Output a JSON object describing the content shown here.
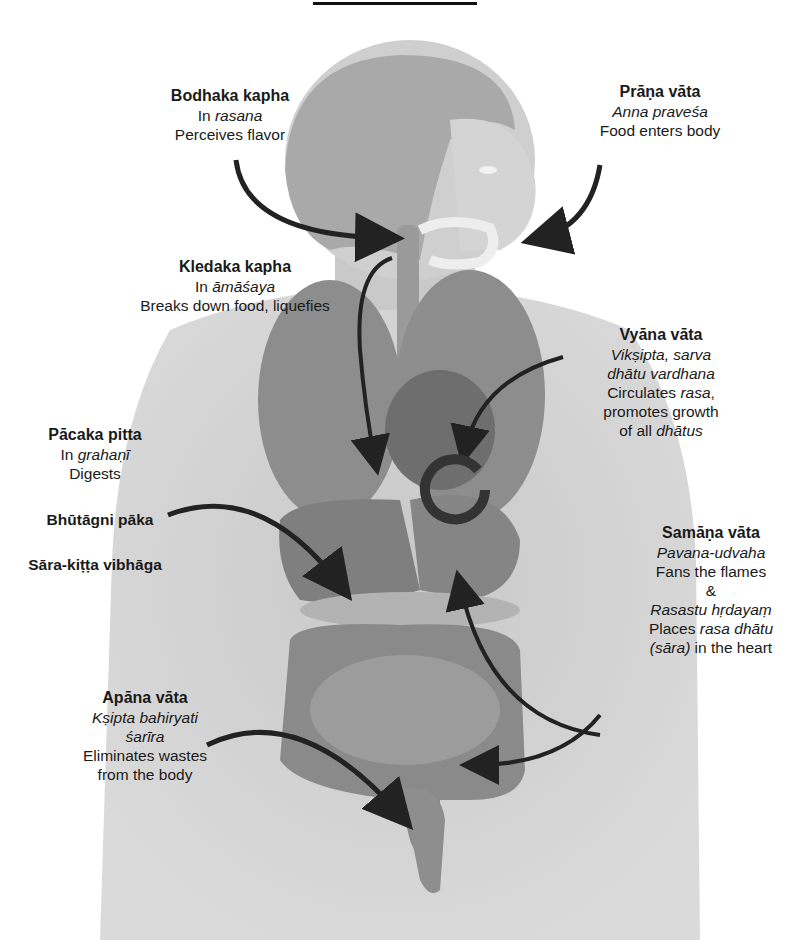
{
  "figure": {
    "colors": {
      "body": "#cfcfcf",
      "organs": "#8a8a8a",
      "arrow": "#222222",
      "text": "#1a1a1a"
    }
  },
  "labels": {
    "bodhaka": {
      "title": "Bodhaka kapha",
      "line1_pre": "In ",
      "line1_it": "rasana",
      "line2": "Perceives flavor"
    },
    "prana": {
      "title": "Prāṇa vāta",
      "line1_it": "Anna praveśa",
      "line2": "Food enters body"
    },
    "kledaka": {
      "title": "Kledaka kapha",
      "line1_pre": "In ",
      "line1_it": "āmāśaya",
      "line2": "Breaks down food, liquefies"
    },
    "vyana": {
      "title": "Vyāna vāta",
      "line1_it": "Vikṣipta, sarva",
      "line2_it": "dhātu vardhana",
      "line3_pre": "Circulates ",
      "line3_it": "rasa",
      "line3_post": ",",
      "line4": "promotes growth",
      "line5_pre": "of all ",
      "line5_it": "dhātus"
    },
    "pacaka": {
      "title": "Pācaka pitta",
      "line1_pre": "In ",
      "line1_it": "grahaṇī",
      "line2": "Digests",
      "line3": "Bhūtāgni pāka",
      "line4": "Sāra-kiṭṭa vibhāga"
    },
    "samana": {
      "title": "Samāṇa vāta",
      "line1_it": "Pavana-udvaha",
      "line2": "Fans the flames",
      "line3": "&",
      "line4_it": "Rasastu hṛdayaṃ",
      "line5_pre": "Places ",
      "line5_it": "rasa dhātu",
      "line6_it": "(sāra)",
      "line6_post": " in the heart"
    },
    "apana": {
      "title": "Apāna vāta",
      "line1_it": "Kṣipta bahiryati",
      "line2_it": "śarīra",
      "line3": "Eliminates wastes",
      "line4": "from the body"
    }
  }
}
